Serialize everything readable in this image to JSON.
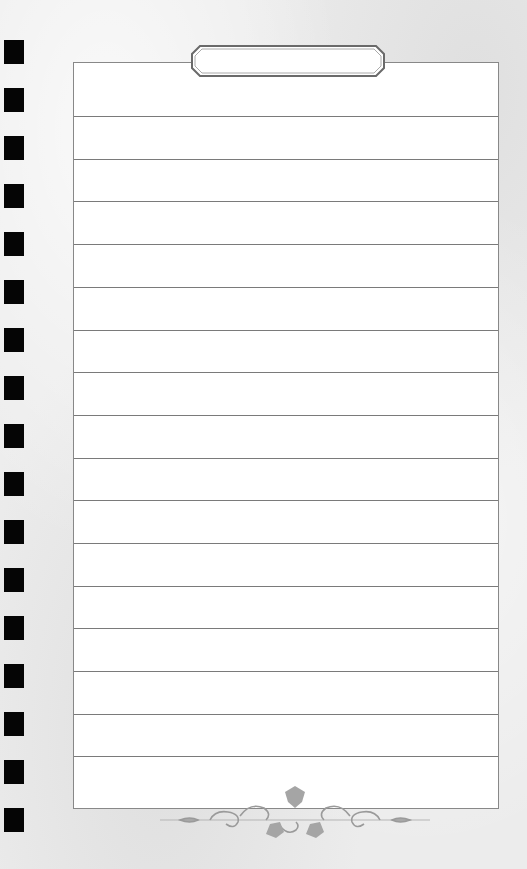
{
  "page": {
    "type": "lined-notebook-page",
    "title_box_text": "",
    "line_count": 16,
    "punch_hole_count": 17
  },
  "colors": {
    "background": "#ececec",
    "paper": "#ffffff",
    "rule": "#7a7a7a",
    "punch": "#050505",
    "ornament": "#9a9a9a"
  },
  "icons": {
    "ornament": "floral-vine-divider-icon"
  }
}
